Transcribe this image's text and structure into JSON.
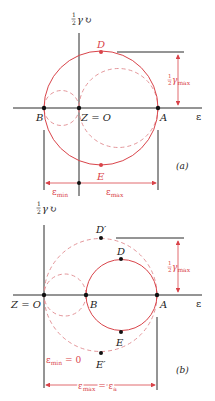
{
  "colors": {
    "axis": "#2a2a2a",
    "circle": "#d9444a",
    "dashed": "#e08a8e",
    "point": "#111111",
    "red_point": "#d9444a"
  },
  "panel_a": {
    "caption": "(a)",
    "axis_y_label": "½γ",
    "axis_x_label": "ε",
    "points": {
      "B": "B",
      "O": "Z = O",
      "A": "A",
      "D": "D",
      "E": "E"
    },
    "gamma_max_label": "½γ",
    "gamma_max_sub": "max",
    "eps_min_label": "ε",
    "eps_min_sub": "min",
    "eps_max_label": "ε",
    "eps_max_sub": "max"
  },
  "panel_b": {
    "caption": "(b)",
    "axis_y_label": "½γ",
    "axis_x_label": "ε",
    "points": {
      "O": "Z = O",
      "B": "B",
      "A": "A",
      "D": "D",
      "E": "E",
      "Dp": "D′",
      "Ep": "E′"
    },
    "gamma_max_label": "½γ",
    "gamma_max_sub": "max",
    "eps_min_label": "ε",
    "eps_min_sub": "min",
    "eps_min_value": " = 0",
    "eps_max_label": "ε",
    "eps_max_sub": "max",
    "eps_max_eq": " = ε",
    "eps_max_eq_sub": "a"
  }
}
